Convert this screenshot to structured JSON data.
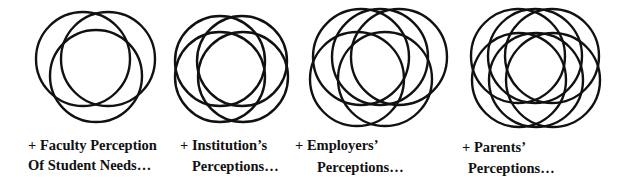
{
  "diagram": {
    "stroke_color": "#111111",
    "background": "#ffffff",
    "groups": [
      {
        "id": "faculty",
        "circle_count": 3,
        "circles": [
          {
            "cx": 83,
            "cy": 59,
            "r": 47
          },
          {
            "cx": 108,
            "cy": 59,
            "r": 47
          },
          {
            "cx": 96,
            "cy": 76,
            "r": 46
          }
        ],
        "caption_line1": "+ Faculty Perception",
        "caption_line2": "Of Student Needs…"
      },
      {
        "id": "institution",
        "circle_count": 4,
        "circles": [
          {
            "cx": 220,
            "cy": 61,
            "r": 45
          },
          {
            "cx": 242,
            "cy": 61,
            "r": 45
          },
          {
            "cx": 220,
            "cy": 77,
            "r": 45
          },
          {
            "cx": 243,
            "cy": 77,
            "r": 45
          }
        ],
        "caption_line1": "+ Institution’s",
        "caption_line2": "Perceptions…"
      },
      {
        "id": "employers",
        "circle_count": 5,
        "circles": [
          {
            "cx": 361,
            "cy": 57,
            "r": 48
          },
          {
            "cx": 380,
            "cy": 57,
            "r": 48
          },
          {
            "cx": 399,
            "cy": 57,
            "r": 48
          },
          {
            "cx": 357,
            "cy": 79,
            "r": 47
          },
          {
            "cx": 385,
            "cy": 79,
            "r": 47
          }
        ],
        "caption_line1": "+ Employers’",
        "caption_line2": "Perceptions…"
      },
      {
        "id": "parents",
        "circle_count": 6,
        "circles": [
          {
            "cx": 518,
            "cy": 56,
            "r": 47
          },
          {
            "cx": 535,
            "cy": 56,
            "r": 47
          },
          {
            "cx": 552,
            "cy": 56,
            "r": 47
          },
          {
            "cx": 519,
            "cy": 80,
            "r": 47
          },
          {
            "cx": 536,
            "cy": 80,
            "r": 47
          },
          {
            "cx": 553,
            "cy": 80,
            "r": 47
          }
        ],
        "caption_line1": "+ Parents’",
        "caption_line2": "Perceptions…"
      }
    ]
  }
}
